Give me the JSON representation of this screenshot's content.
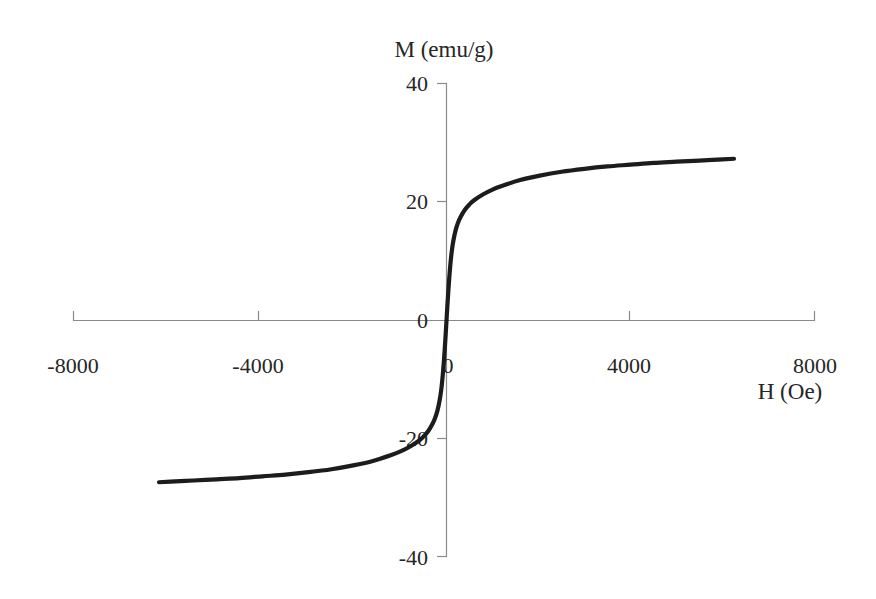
{
  "chart_data": {
    "type": "line",
    "title": "",
    "xlabel": "H (Oe)",
    "ylabel": "M (emu/g)",
    "ylabel_position": "top-center",
    "xlabel_position": "bottom-right",
    "xlim": [
      -8000,
      8000
    ],
    "ylim": [
      -40,
      40
    ],
    "xticks": [
      -8000,
      -4000,
      0,
      4000,
      8000
    ],
    "xtick_labels": [
      "-8000",
      "-4000",
      "0",
      "4000",
      "8000"
    ],
    "yticks": [
      40,
      20,
      0,
      -20,
      -40
    ],
    "ytick_labels": [
      "40",
      "20",
      "0",
      "-20",
      "-40"
    ],
    "grid": false,
    "legend": false,
    "curve_description": "Superparamagnetic magnetization curve, anhysteretic (no coercivity, no remanence), passing through the origin and saturating near +/-27.5 emu/g",
    "saturation_magnetization": 27.5,
    "coercivity": 0,
    "remanence": 0,
    "series": [
      {
        "name": "M vs H",
        "color": "#1c1c1c",
        "x": [
          -6250,
          -6000,
          -5500,
          -5000,
          -4500,
          -4000,
          -3500,
          -3000,
          -2500,
          -2000,
          -1600,
          -1200,
          -1000,
          -800,
          -600,
          -500,
          -400,
          -300,
          -250,
          -200,
          -150,
          -120,
          -100,
          -80,
          -60,
          -40,
          -20,
          0,
          20,
          40,
          60,
          80,
          100,
          120,
          150,
          200,
          250,
          300,
          400,
          500,
          600,
          800,
          1000,
          1200,
          1600,
          2000,
          2500,
          3000,
          3500,
          4000,
          4500,
          5000,
          5500,
          6000,
          6250
        ],
        "y": [
          -27.3,
          -27.2,
          -27.0,
          -26.8,
          -26.6,
          -26.3,
          -26.0,
          -25.6,
          -25.1,
          -24.4,
          -23.7,
          -22.7,
          -22.1,
          -21.3,
          -20.3,
          -19.6,
          -18.7,
          -17.4,
          -16.5,
          -15.3,
          -13.5,
          -12.0,
          -10.7,
          -9.1,
          -7.2,
          -5.0,
          -2.6,
          0.0,
          2.6,
          5.0,
          7.2,
          9.1,
          10.7,
          12.0,
          13.5,
          15.3,
          16.5,
          17.4,
          18.7,
          19.6,
          20.3,
          21.3,
          22.1,
          22.7,
          23.7,
          24.4,
          25.1,
          25.6,
          26.0,
          26.3,
          26.6,
          26.8,
          27.0,
          27.2,
          27.3
        ]
      }
    ]
  },
  "axes": {
    "y_title": "M (emu/g)",
    "x_title": "H (Oe)",
    "y_tick_0": "40",
    "y_tick_1": "20",
    "y_tick_2": "0",
    "y_tick_3": "-20",
    "y_tick_4": "-40",
    "x_tick_0": "-8000",
    "x_tick_1": "-4000",
    "x_tick_2": "0",
    "x_tick_3": "4000",
    "x_tick_4": "8000"
  },
  "style": {
    "background": "#ffffff",
    "curve_color": "#1c1c1c",
    "axis_color": "#8a8a8a",
    "text_color": "#262626"
  }
}
